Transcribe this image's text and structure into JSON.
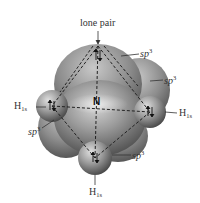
{
  "figure": {
    "central_atom": "N",
    "lone_pair_label": "lone pair",
    "hybrid_label": {
      "base": "sp",
      "sup": "3"
    },
    "hydrogen_label": {
      "base": "H",
      "sub": "1s"
    },
    "sp3_labels": [
      {
        "id": "top",
        "base": "sp",
        "sup": "3"
      },
      {
        "id": "right",
        "base": "sp",
        "sup": "3"
      },
      {
        "id": "left",
        "base": "sp",
        "sup": "3"
      },
      {
        "id": "bottom",
        "base": "sp",
        "sup": "3"
      }
    ],
    "h_labels": [
      {
        "id": "left",
        "base": "H",
        "sub": "1s"
      },
      {
        "id": "right",
        "base": "H",
        "sub": "1s"
      },
      {
        "id": "bottom",
        "base": "H",
        "sub": "1s"
      }
    ],
    "colors": {
      "orbital_light": "#b8b8b8",
      "orbital_dark": "#4a4a4a",
      "text": "#333333",
      "dashes": "#222222"
    }
  }
}
